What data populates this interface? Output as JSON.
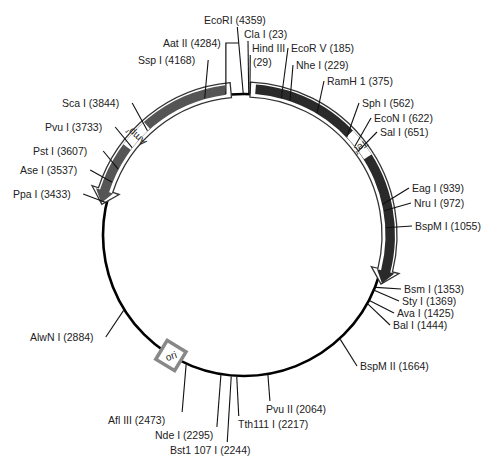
{
  "plasmid": {
    "total_bp": 4363,
    "center": [
      244,
      235
    ],
    "radius": 141,
    "colors": {
      "backbone": "#000000",
      "tet": "#2a2a2a",
      "amp": "#555555",
      "ori_box": "#888888",
      "text": "#222222"
    }
  },
  "features": [
    {
      "name": "Tet-r",
      "label": "Tet",
      "sup": "r",
      "start": 30,
      "end": 1330,
      "color": "#2a2a2a"
    },
    {
      "name": "Amp-r",
      "label": "Amp",
      "sup": "r",
      "start": 4300,
      "end": 3420,
      "color": "#555555"
    },
    {
      "name": "ori",
      "label": "ori",
      "position": 2560
    }
  ],
  "sites": [
    {
      "label": "EcoRI (4359)",
      "pos": 4359,
      "lx": 204,
      "ly": 24,
      "anchor": "start"
    },
    {
      "label": "Cla I (23)",
      "pos": 23,
      "lx": 244,
      "ly": 38,
      "anchor": "start"
    },
    {
      "label": "Hind III",
      "label2": "(29)",
      "pos": 29,
      "lx": 252,
      "ly": 52,
      "anchor": "start"
    },
    {
      "label": "EcoR V (185)",
      "pos": 185,
      "lx": 291,
      "ly": 52,
      "anchor": "start"
    },
    {
      "label": "Nhe I (229)",
      "pos": 229,
      "lx": 296,
      "ly": 69,
      "anchor": "start"
    },
    {
      "label": "RamH 1 (375)",
      "pos": 375,
      "lx": 327,
      "ly": 85,
      "anchor": "start"
    },
    {
      "label": "Sph I (562)",
      "pos": 562,
      "lx": 362,
      "ly": 107,
      "anchor": "start"
    },
    {
      "label": "EcoN I (622)",
      "pos": 622,
      "lx": 374,
      "ly": 122,
      "anchor": "start"
    },
    {
      "label": "Sal I (651)",
      "pos": 651,
      "lx": 380,
      "ly": 136,
      "anchor": "start"
    },
    {
      "label": "Eag I (939)",
      "pos": 939,
      "lx": 412,
      "ly": 192,
      "anchor": "start"
    },
    {
      "label": "Nru I (972)",
      "pos": 972,
      "lx": 414,
      "ly": 207,
      "anchor": "start"
    },
    {
      "label": "BspM I (1055)",
      "pos": 1055,
      "lx": 415,
      "ly": 230,
      "anchor": "start"
    },
    {
      "label": "Bsm I (1353)",
      "pos": 1353,
      "lx": 404,
      "ly": 293,
      "anchor": "start"
    },
    {
      "label": "Sty I (1369)",
      "pos": 1369,
      "lx": 402,
      "ly": 305,
      "anchor": "start"
    },
    {
      "label": "Ava I (1425)",
      "pos": 1425,
      "lx": 397,
      "ly": 317,
      "anchor": "start"
    },
    {
      "label": "Bal I (1444)",
      "pos": 1444,
      "lx": 393,
      "ly": 329,
      "anchor": "start"
    },
    {
      "label": "BspM II (1664)",
      "pos": 1664,
      "lx": 360,
      "ly": 370,
      "anchor": "start"
    },
    {
      "label": "Pvu II (2064)",
      "pos": 2064,
      "lx": 266,
      "ly": 413,
      "anchor": "start"
    },
    {
      "label": "Tth111 I (2217)",
      "pos": 2217,
      "lx": 238,
      "ly": 428,
      "anchor": "start"
    },
    {
      "label": "Bst1 107 I (2244)",
      "pos": 2244,
      "lx": 170,
      "ly": 454,
      "anchor": "start"
    },
    {
      "label": "Nde I (2295)",
      "pos": 2295,
      "lx": 155,
      "ly": 439,
      "anchor": "start"
    },
    {
      "label": "Afl III (2473)",
      "pos": 2473,
      "lx": 108,
      "ly": 424,
      "anchor": "start"
    },
    {
      "label": "AlwN I (2884)",
      "pos": 2884,
      "lx": 30,
      "ly": 341,
      "anchor": "start"
    },
    {
      "label": "Ppa I (3433)",
      "pos": 3433,
      "lx": 13,
      "ly": 198,
      "anchor": "start"
    },
    {
      "label": "Ase I (3537)",
      "pos": 3537,
      "lx": 20,
      "ly": 174,
      "anchor": "start"
    },
    {
      "label": "Pst I (3607)",
      "pos": 3607,
      "lx": 33,
      "ly": 155,
      "anchor": "start"
    },
    {
      "label": "Pvu I (3733)",
      "pos": 3733,
      "lx": 45,
      "ly": 131,
      "anchor": "start"
    },
    {
      "label": "Sca I (3844)",
      "pos": 3844,
      "lx": 62,
      "ly": 107,
      "anchor": "start"
    },
    {
      "label": "Ssp I (4168)",
      "pos": 4168,
      "lx": 138,
      "ly": 64,
      "anchor": "start"
    },
    {
      "label": "Aat II (4284)",
      "pos": 4284,
      "lx": 163,
      "ly": 47,
      "anchor": "start"
    }
  ]
}
